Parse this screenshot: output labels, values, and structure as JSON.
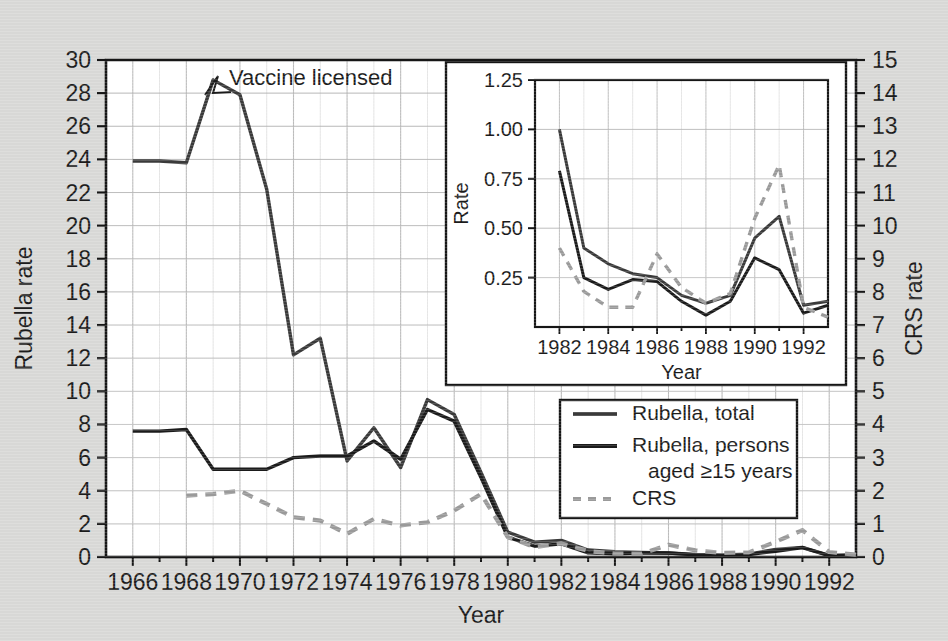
{
  "figure": {
    "background_color": "#d8d8d6",
    "plot_background_color": "#ffffff",
    "line_color": "#2b2b2b",
    "crs_color": "#9a9a9a",
    "grid_color": "#b9b9b9"
  },
  "main_axes": {
    "y_left_label": "Rubella rate",
    "y_right_label": "CRS rate",
    "x_label": "Year",
    "y_left_ticks": [
      "0",
      "2",
      "4",
      "6",
      "8",
      "10",
      "12",
      "14",
      "16",
      "18",
      "20",
      "22",
      "24",
      "26",
      "28",
      "30"
    ],
    "y_right_ticks": [
      "0",
      "1",
      "2",
      "3",
      "4",
      "5",
      "6",
      "7",
      "8",
      "9",
      "10",
      "11",
      "12",
      "13",
      "14",
      "15"
    ],
    "x_ticks": [
      "1966",
      "1968",
      "1970",
      "1972",
      "1974",
      "1976",
      "1978",
      "1980",
      "1982",
      "1984",
      "1986",
      "1988",
      "1990",
      "1992"
    ]
  },
  "annotation": {
    "text": "Vaccine licensed"
  },
  "legend": {
    "items": [
      {
        "label": "Rubella, total",
        "style": "solid",
        "color": "#3a3a3a"
      },
      {
        "label": "Rubella, persons",
        "label2": "aged ≥15 years",
        "style": "solid",
        "color": "#1b1b1b"
      },
      {
        "label": "CRS",
        "style": "dashed",
        "color": "#9a9a9a"
      }
    ]
  },
  "inset_axes": {
    "y_label": "Rate",
    "x_label": "Year",
    "y_ticks": [
      "0.25",
      "0.50",
      "0.75",
      "1.00",
      "1.25"
    ],
    "x_ticks": [
      "1982",
      "1984",
      "1986",
      "1988",
      "1990",
      "1992"
    ]
  },
  "chart_data": {
    "type": "line",
    "title": "",
    "xlabel": "Year",
    "ylabel": "Rubella rate",
    "y2label": "CRS rate",
    "grid": true,
    "legend_position": "lower-right",
    "xlim": [
      1965,
      1993
    ],
    "ylim": [
      0,
      30
    ],
    "y2lim": [
      0,
      15
    ],
    "x": [
      1966,
      1967,
      1968,
      1969,
      1970,
      1971,
      1972,
      1973,
      1974,
      1975,
      1976,
      1977,
      1978,
      1979,
      1980,
      1981,
      1982,
      1983,
      1984,
      1985,
      1986,
      1987,
      1988,
      1989,
      1990,
      1991,
      1992,
      1993
    ],
    "series": [
      {
        "name": "Rubella, total",
        "axis": "left",
        "style": "solid",
        "color": "#3a3a3a",
        "values": [
          23.9,
          23.9,
          23.8,
          28.8,
          27.9,
          22.2,
          12.2,
          13.2,
          5.8,
          7.8,
          5.4,
          9.5,
          8.6,
          5.1,
          1.5,
          0.9,
          1.0,
          0.42,
          0.32,
          0.28,
          0.24,
          0.16,
          0.12,
          0.17,
          0.46,
          0.58,
          0.1,
          0.12
        ]
      },
      {
        "name": "Rubella, persons aged >=15 years",
        "axis": "left",
        "style": "solid",
        "color": "#1b1b1b",
        "values": [
          7.6,
          7.6,
          7.7,
          5.3,
          5.3,
          5.3,
          6.0,
          6.1,
          6.1,
          7.0,
          5.9,
          8.9,
          8.2,
          4.8,
          1.2,
          0.65,
          0.79,
          0.25,
          0.19,
          0.24,
          0.24,
          0.13,
          0.07,
          0.15,
          0.35,
          0.57,
          0.08,
          0.13
        ]
      },
      {
        "name": "CRS",
        "axis": "right",
        "style": "dashed",
        "color": "#9a9a9a",
        "values": [
          null,
          null,
          1.85,
          1.9,
          2.0,
          1.6,
          1.2,
          1.1,
          0.7,
          1.15,
          0.95,
          1.05,
          1.4,
          1.9,
          0.6,
          0.3,
          0.41,
          0.18,
          0.1,
          0.1,
          0.37,
          0.2,
          0.12,
          0.14,
          0.46,
          0.81,
          0.15,
          0.07
        ]
      }
    ]
  },
  "inset_chart_data": {
    "type": "line",
    "xlabel": "Year",
    "ylabel": "Rate",
    "grid": true,
    "xlim": [
      1981,
      1993
    ],
    "ylim": [
      0,
      1.25
    ],
    "x": [
      1982,
      1983,
      1984,
      1985,
      1986,
      1987,
      1988,
      1989,
      1990,
      1991,
      1992,
      1993
    ],
    "series": [
      {
        "name": "Rubella, total",
        "style": "solid",
        "color": "#3a3a3a",
        "values": [
          1.0,
          0.4,
          0.32,
          0.27,
          0.25,
          0.16,
          0.12,
          0.16,
          0.45,
          0.56,
          0.11,
          0.13
        ]
      },
      {
        "name": "Rubella, persons aged >=15 years",
        "style": "solid",
        "color": "#1b1b1b",
        "values": [
          0.79,
          0.25,
          0.19,
          0.24,
          0.23,
          0.13,
          0.06,
          0.13,
          0.35,
          0.29,
          0.07,
          0.11
        ]
      },
      {
        "name": "CRS",
        "style": "dashed",
        "color": "#9a9a9a",
        "values": [
          0.4,
          0.18,
          0.1,
          0.1,
          0.37,
          0.2,
          0.12,
          0.17,
          0.55,
          0.82,
          0.1,
          0.05
        ]
      }
    ]
  }
}
